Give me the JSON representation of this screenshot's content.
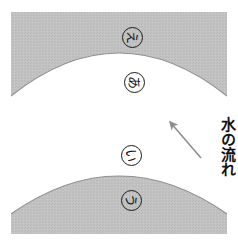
{
  "figure": {
    "background_color": "#ffffff",
    "band_color": "#bfbfbf",
    "band_stroke_color": "#8a8a8a",
    "label_text_color": "#111111",
    "arrow_color": "#8c8c8c",
    "width": 238,
    "height": 246
  },
  "bands": [
    {
      "name": "upper-band",
      "label": "上側の帯",
      "fill": "#bfbfbf"
    },
    {
      "name": "lower-band",
      "label": "下側の帯",
      "fill": "#bfbfbf"
    }
  ],
  "markers": [
    {
      "id": "marker-e",
      "char": "え",
      "x": 122,
      "y": 27
    },
    {
      "id": "marker-a",
      "char": "あ",
      "x": 124,
      "y": 72
    },
    {
      "id": "marker-i",
      "char": "い",
      "x": 121,
      "y": 145
    },
    {
      "id": "marker-u",
      "char": "う",
      "x": 121,
      "y": 190
    }
  ],
  "annotation": {
    "flow_label": "水の流れ",
    "arrow_name": "flow-direction-arrow",
    "arrow_direction": "up-left"
  }
}
